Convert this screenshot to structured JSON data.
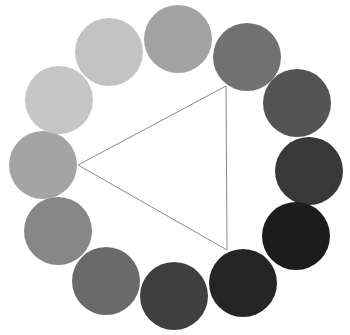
{
  "diagram": {
    "type": "color-wheel-grayscale",
    "canvas": {
      "width": 350,
      "height": 335,
      "background": "#ffffff"
    },
    "circle_radius": 34,
    "circles": [
      {
        "id": "top",
        "cx": 178,
        "cy": 39,
        "fill": "#a2a2a2"
      },
      {
        "id": "upper-right",
        "cx": 247,
        "cy": 57,
        "fill": "#717171"
      },
      {
        "id": "right-upper",
        "cx": 297,
        "cy": 103,
        "fill": "#545454"
      },
      {
        "id": "right",
        "cx": 309,
        "cy": 171,
        "fill": "#383838"
      },
      {
        "id": "lower-right",
        "cx": 296,
        "cy": 236,
        "fill": "#1c1c1c"
      },
      {
        "id": "bottom-right",
        "cx": 243,
        "cy": 283,
        "fill": "#252525"
      },
      {
        "id": "bottom",
        "cx": 174,
        "cy": 296,
        "fill": "#3f3f3f"
      },
      {
        "id": "lower-left",
        "cx": 106,
        "cy": 281,
        "fill": "#6a6a6a"
      },
      {
        "id": "left-lower",
        "cx": 58,
        "cy": 231,
        "fill": "#878787"
      },
      {
        "id": "left",
        "cx": 43,
        "cy": 165,
        "fill": "#a4a4a4"
      },
      {
        "id": "upper-left",
        "cx": 59,
        "cy": 100,
        "fill": "#c6c6c6"
      },
      {
        "id": "top-left",
        "cx": 109,
        "cy": 52,
        "fill": "#c3c3c3"
      }
    ],
    "triangle": {
      "stroke": "#8a8a8a",
      "stroke_width": 1,
      "points": [
        {
          "x": 78,
          "y": 165
        },
        {
          "x": 226,
          "y": 86
        },
        {
          "x": 227,
          "y": 250
        }
      ]
    }
  }
}
